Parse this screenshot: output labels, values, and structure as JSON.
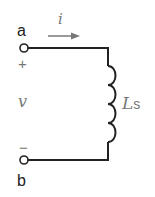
{
  "diagram": {
    "type": "circuit",
    "terminals": [
      {
        "id": "a",
        "label": "a",
        "polarity": "+"
      },
      {
        "id": "b",
        "label": "b",
        "polarity": "−"
      }
    ],
    "current": {
      "label": "i",
      "direction": "right"
    },
    "voltage": {
      "label": "v"
    },
    "component": {
      "kind": "inductor",
      "label_main": "L",
      "label_sub": "s"
    }
  },
  "colors": {
    "wire": "#222222",
    "label": "#777777"
  }
}
